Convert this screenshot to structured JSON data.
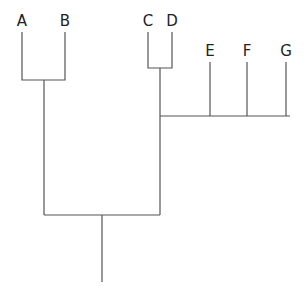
{
  "diagram": {
    "type": "dendrogram",
    "taxa": [
      "A",
      "B",
      "C",
      "D",
      "E",
      "F",
      "G"
    ],
    "labels": {
      "a": "A",
      "b": "B",
      "c": "C",
      "d": "D",
      "e": "E",
      "f": "F",
      "g": "G"
    },
    "topology": "((A,B),((C,D),E,F,G))",
    "line_color": "#555555",
    "background": "#ffffff"
  }
}
